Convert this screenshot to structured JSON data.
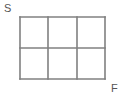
{
  "figure": {
    "background_color": "#ffffff",
    "line_color": "#808080",
    "label_color": "#555555",
    "line_width": 1.6
  },
  "grid": {
    "columns": 3,
    "rows": 2,
    "cells": 6,
    "left": 20,
    "top": 17,
    "right": 105,
    "bottom": 79,
    "width": 85,
    "height": 62,
    "vertical_lines_x": [
      20,
      48,
      77,
      105
    ],
    "horizontal_lines_y": [
      17,
      48,
      79
    ]
  },
  "labels": {
    "start": "S",
    "finish": "F"
  }
}
